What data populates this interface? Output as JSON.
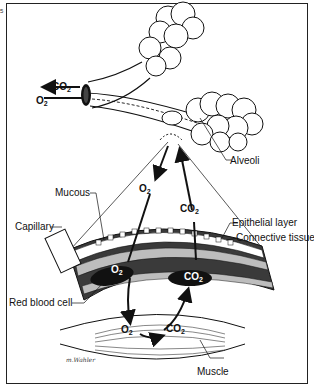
{
  "figure": {
    "colors": {
      "line": "#111111",
      "tissue_dark": "#3a3a3a",
      "tissue_mid": "#6e6e6e",
      "tissue_light": "#bdbdbd",
      "rbc": "#111111",
      "background": "#ffffff"
    },
    "labels": {
      "alveoli": "Alveoli",
      "mucous": "Mucous",
      "capillary": "Capillary",
      "epithelial": "Epithelial layer",
      "connective": "Connective tissue",
      "rbc": "Red blood cell",
      "muscle": "Muscle"
    },
    "gases": {
      "co2_airway": {
        "base": "CO",
        "sub": "2"
      },
      "o2_airway": {
        "base": "O",
        "sub": "2"
      },
      "o2_down": {
        "base": "O",
        "sub": "2"
      },
      "co2_up": {
        "base": "CO",
        "sub": "2"
      },
      "o2_capillary": {
        "base": "O",
        "sub": "2"
      },
      "co2_capillary": {
        "base": "CO",
        "sub": "2"
      },
      "o2_muscle": {
        "base": "O",
        "sub": "2"
      },
      "co2_muscle": {
        "base": "CO",
        "sub": "2"
      }
    },
    "signature": "m.Wahler",
    "corner_mark": "5"
  }
}
